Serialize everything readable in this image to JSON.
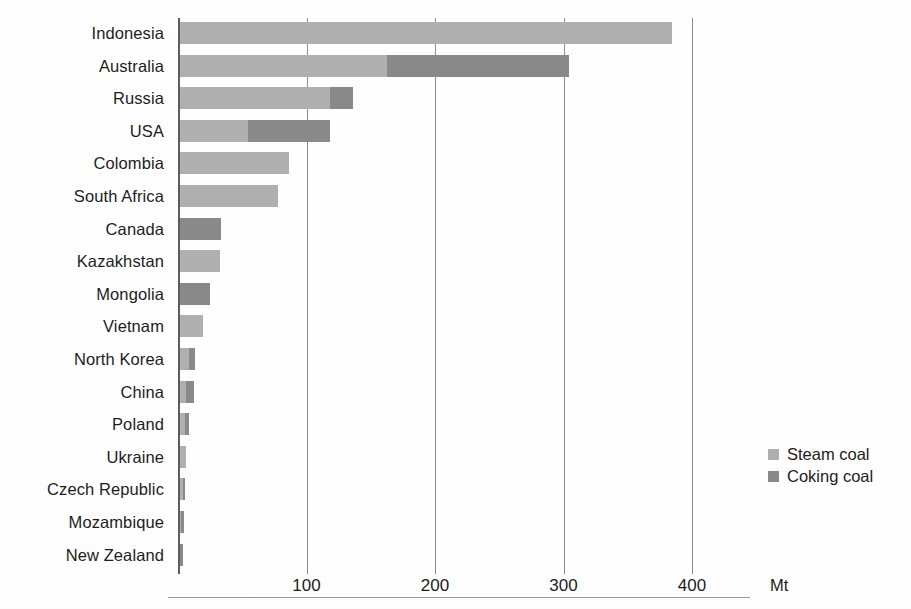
{
  "chart_data": {
    "type": "bar",
    "orientation": "horizontal",
    "stacked": true,
    "title": "",
    "subtitle": "",
    "xlabel": "Mt",
    "ylabel": "",
    "xlim": [
      0,
      430
    ],
    "xticks": [
      100,
      200,
      300,
      400
    ],
    "xtick_labels": [
      "100",
      "200",
      "300",
      "400"
    ],
    "grid": "vertical-gridlines-at-xticks",
    "legend_position": "right-middle",
    "categories": [
      "Indonesia",
      "Australia",
      "Russia",
      "USA",
      "Colombia",
      "South Africa",
      "Canada",
      "Kazakhstan",
      "Mongolia",
      "Vietnam",
      "North Korea",
      "China",
      "Poland",
      "Ukraine",
      "Czech Republic",
      "Mozambique",
      "New Zealand"
    ],
    "series": [
      {
        "name": "Steam coal",
        "color": "#b0b0b0",
        "values": [
          383,
          161,
          117,
          53,
          85,
          76,
          0,
          31,
          0,
          18,
          7,
          5,
          4,
          5,
          2,
          1,
          0
        ]
      },
      {
        "name": "Coking coal",
        "color": "#8a8a8a",
        "values": [
          0,
          142,
          18,
          64,
          0,
          0,
          32,
          0,
          23,
          0,
          5,
          6,
          3,
          0,
          2,
          2,
          2
        ]
      }
    ],
    "totals": [
      383,
      303,
      135,
      117,
      85,
      76,
      32,
      31,
      23,
      18,
      12,
      11,
      7,
      5,
      4,
      3,
      2
    ]
  },
  "legend": {
    "items": [
      {
        "label": "Steam coal",
        "color": "#b0b0b0"
      },
      {
        "label": "Coking coal",
        "color": "#8a8a8a"
      }
    ]
  },
  "axis": {
    "unit": "Mt",
    "tick_labels": [
      "100",
      "200",
      "300",
      "400"
    ]
  }
}
